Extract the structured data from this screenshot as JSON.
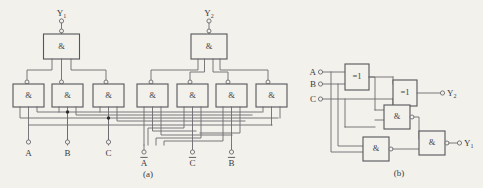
{
  "figure": {
    "background_color": "#f3f1ec",
    "line_color": "#6b6b70",
    "text_color": "#3a3a40",
    "captions": {
      "left": "(a)",
      "right": "(b)"
    }
  },
  "diagram_a": {
    "name": "nand-only-implementation",
    "gate_symbol": "&",
    "outputs": [
      {
        "id": "y1",
        "label": "Y",
        "subscript": "1"
      },
      {
        "id": "y2",
        "label": "Y",
        "subscript": "2"
      }
    ],
    "inputs_left": [
      {
        "id": "a",
        "label": "A",
        "bar": false
      },
      {
        "id": "b",
        "label": "B",
        "bar": false
      },
      {
        "id": "c",
        "label": "C",
        "bar": false
      }
    ],
    "inputs_right": [
      {
        "id": "a-bar",
        "label": "A",
        "bar": true
      },
      {
        "id": "c-bar",
        "label": "C",
        "bar": true
      },
      {
        "id": "b-bar",
        "label": "B",
        "bar": true
      }
    ],
    "top_gates": [
      {
        "id": "nand-y1",
        "symbol": "&"
      },
      {
        "id": "nand-y2",
        "symbol": "&"
      }
    ],
    "bottom_gates": [
      {
        "id": "nand-1",
        "symbol": "&"
      },
      {
        "id": "nand-2",
        "symbol": "&"
      },
      {
        "id": "nand-3",
        "symbol": "&"
      },
      {
        "id": "nand-4",
        "symbol": "&"
      },
      {
        "id": "nand-5",
        "symbol": "&"
      },
      {
        "id": "nand-6",
        "symbol": "&"
      },
      {
        "id": "nand-7",
        "symbol": "&"
      }
    ]
  },
  "diagram_b": {
    "name": "xor-and-implementation",
    "inputs": [
      {
        "id": "a",
        "label": "A"
      },
      {
        "id": "b",
        "label": "B"
      },
      {
        "id": "c",
        "label": "C"
      }
    ],
    "outputs": [
      {
        "id": "y2",
        "label": "Y",
        "subscript": "2"
      },
      {
        "id": "y1",
        "label": "Y",
        "subscript": "1"
      }
    ],
    "gates": [
      {
        "id": "xor-1",
        "symbol": "=1",
        "type": "xor"
      },
      {
        "id": "xor-2",
        "symbol": "=1",
        "type": "xor"
      },
      {
        "id": "nand-upper",
        "symbol": "&",
        "type": "nand"
      },
      {
        "id": "nand-lower",
        "symbol": "&",
        "type": "nand"
      },
      {
        "id": "nand-out",
        "symbol": "&",
        "type": "nand"
      }
    ]
  }
}
